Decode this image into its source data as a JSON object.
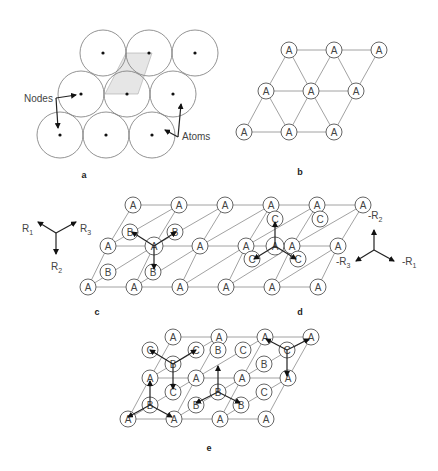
{
  "panels": {
    "a": {
      "caption": "a",
      "nodes_label": "Nodes",
      "atoms_label": "Atoms"
    },
    "b": {
      "caption": "b",
      "atom_label": "A"
    },
    "c": {
      "caption": "c",
      "vectors": [
        "R1",
        "R2",
        "R3"
      ]
    },
    "d": {
      "caption": "d",
      "vectors": [
        "-R1",
        "-R2",
        "-R3"
      ]
    },
    "e": {
      "caption": "e"
    }
  },
  "labels": {
    "r1": "R",
    "r1_sub": "1",
    "r2": "R",
    "r2_sub": "2",
    "r3": "R",
    "r3_sub": "3",
    "mr1": "-R",
    "mr1_sub": "1",
    "mr2": "-R",
    "mr2_sub": "2",
    "mr3": "-R",
    "mr3_sub": "3"
  },
  "lattice": {
    "b": [
      "A",
      "A",
      "A",
      "A",
      "A",
      "A",
      "A",
      "A",
      "A"
    ],
    "c_A": "A",
    "c_B": "B",
    "d_A": "A",
    "d_C": "C",
    "e_site_A": "A",
    "e_site_B": "B",
    "e_site_C": "C"
  }
}
